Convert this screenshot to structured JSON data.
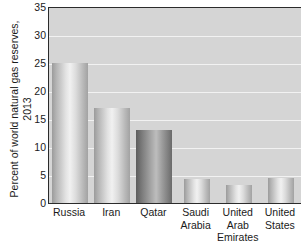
{
  "chart_data": {
    "type": "bar",
    "title": "",
    "subtitle": "",
    "xlabel": "",
    "ylabel": "Percent of world natural gas reserves, 2013",
    "ylabel_lines": [
      "Percent of world natural gas reserves,",
      "2013"
    ],
    "categories": [
      "Russia",
      "Iran",
      "Qatar",
      "Saudi Arabia",
      "United Arab Emirates",
      "United States"
    ],
    "category_lines": [
      [
        "Russia"
      ],
      [
        "Iran"
      ],
      [
        "Qatar"
      ],
      [
        "Saudi",
        "Arabia"
      ],
      [
        "United",
        "Arab",
        "Emirates"
      ],
      [
        "United",
        "States"
      ]
    ],
    "values": [
      25,
      17,
      13,
      4.2,
      3.2,
      4.5
    ],
    "ylim": [
      0,
      35
    ],
    "yticks": [
      0,
      5,
      10,
      15,
      20,
      25,
      30,
      35
    ],
    "ytick_labels": [
      "0",
      "5",
      "10",
      "15",
      "20",
      "25",
      "30",
      "35"
    ],
    "grid": true,
    "grid_color": "#f2f2f2",
    "legend": "none",
    "plot_background": "#d5d5d5",
    "bar_highlight_index": 2,
    "bar_color": "#d8d8d8",
    "bar_highlight_color": "#7f7f7f",
    "axis_color": "#2b2b2b"
  }
}
